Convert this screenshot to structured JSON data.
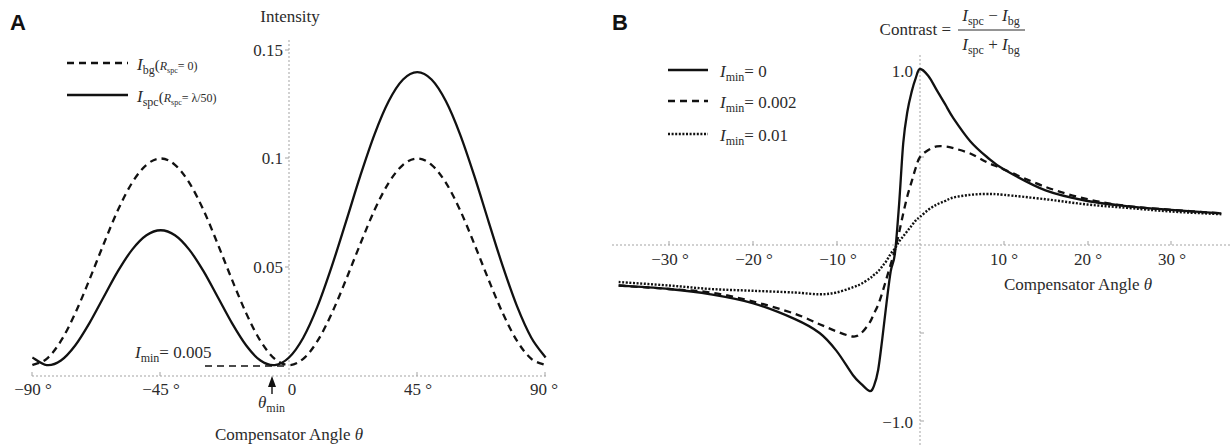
{
  "colors": {
    "curve": "#111111",
    "axis": "#a3a3a3",
    "text": "#2b2b2b"
  },
  "panel_a": {
    "letter": "A",
    "y_axis_title": "Intensity",
    "x_axis_title": {
      "text": "Compensator Angle ",
      "symbol": "θ"
    },
    "x_tick_labels": [
      "−90 °",
      "−45 °",
      "0",
      "45 °",
      "90 °"
    ],
    "y_tick_labels": [
      "0.05",
      "0.1",
      "0.15"
    ],
    "legend": [
      {
        "symbol": "I",
        "sub": "bg",
        "param_open": "(",
        "param_symbol": "R",
        "param_sub": "spc",
        "param_rest": "= 0)",
        "style": "dashed"
      },
      {
        "symbol": "I",
        "sub": "spc",
        "param_open": "(",
        "param_symbol": "R",
        "param_sub": "spc",
        "param_rest": "= λ/50)",
        "style": "solid"
      }
    ],
    "imin_annotation": {
      "symbol": "I",
      "sub": "min",
      "rest": "= 0.005"
    },
    "theta_min_annotation": {
      "symbol": "θ",
      "sub": "min"
    }
  },
  "panel_b": {
    "letter": "B",
    "y_axis_title": {
      "prefix": "Contrast =",
      "numerator": {
        "a_symbol": "I",
        "a_sub": "spc",
        "op": " − ",
        "b_symbol": "I",
        "b_sub": "bg"
      },
      "denominator": {
        "a_symbol": "I",
        "a_sub": "spc",
        "op": " + ",
        "b_symbol": "I",
        "b_sub": "bg"
      }
    },
    "x_axis_title": {
      "text": "Compensator Angle ",
      "symbol": "θ"
    },
    "x_tick_labels": [
      "−30 °",
      "−20 °",
      "−10 °",
      "10 °",
      "20 °",
      "30 °"
    ],
    "y_tick_labels": [
      "1.0",
      "−1.0"
    ],
    "legend": [
      {
        "symbol": "I",
        "sub": "min",
        "rest": "= 0",
        "style": "solid"
      },
      {
        "symbol": "I",
        "sub": "min",
        "rest": "= 0.002",
        "style": "dashed"
      },
      {
        "symbol": "I",
        "sub": "min",
        "rest": "= 0.01",
        "style": "dotted"
      }
    ]
  },
  "chart_data": [
    {
      "type": "line",
      "panel": "A",
      "title": "Intensity",
      "xlabel": "Compensator Angle θ",
      "ylabel": "Intensity",
      "xlim": [
        -90,
        90
      ],
      "ylim": [
        0,
        0.15
      ],
      "x_ticks": [
        -90,
        -45,
        0,
        45,
        90
      ],
      "y_ticks": [
        0.05,
        0.1,
        0.15
      ],
      "grid": false,
      "legend_position": "upper left",
      "x": [
        -90,
        -85,
        -80,
        -75,
        -70,
        -65,
        -60,
        -55,
        -50,
        -45,
        -40,
        -35,
        -30,
        -25,
        -20,
        -15,
        -10,
        -5,
        0,
        5,
        10,
        15,
        20,
        25,
        30,
        35,
        40,
        45,
        50,
        55,
        60,
        65,
        70,
        75,
        80,
        85,
        90
      ],
      "series": [
        {
          "name": "I_bg (R_spc = 0)",
          "style": "dashed",
          "values": [
            0.005,
            0.0079,
            0.0161,
            0.0288,
            0.0443,
            0.0607,
            0.0763,
            0.0889,
            0.0971,
            0.1,
            0.0971,
            0.0889,
            0.0763,
            0.0607,
            0.0443,
            0.0288,
            0.0161,
            0.0079,
            0.005,
            0.0079,
            0.0161,
            0.0288,
            0.0443,
            0.0607,
            0.0763,
            0.0889,
            0.0971,
            0.1,
            0.0971,
            0.0889,
            0.0763,
            0.0607,
            0.0443,
            0.0288,
            0.0161,
            0.0079,
            0.005
          ]
        },
        {
          "name": "I_spc (R_spc = λ/50)",
          "style": "solid",
          "values": [
            0.0085,
            0.005,
            0.0071,
            0.014,
            0.0243,
            0.0363,
            0.0482,
            0.0581,
            0.0647,
            0.067,
            0.0647,
            0.0581,
            0.0482,
            0.0363,
            0.0243,
            0.014,
            0.0071,
            0.005,
            0.0085,
            0.0176,
            0.032,
            0.0504,
            0.071,
            0.092,
            0.1111,
            0.1264,
            0.1363,
            0.1397,
            0.1363,
            0.1264,
            0.1111,
            0.092,
            0.071,
            0.0504,
            0.032,
            0.0176,
            0.0085
          ]
        }
      ],
      "annotations": [
        {
          "text": "I_min = 0.005",
          "type": "horizontal dashed segment",
          "y": 0.005,
          "x_range": [
            -29,
            0
          ]
        },
        {
          "text": "θ_min",
          "type": "arrow",
          "x": -5.5
        }
      ]
    },
    {
      "type": "line",
      "panel": "B",
      "title": "Contrast = (I_spc − I_bg) / (I_spc + I_bg)",
      "xlabel": "Compensator Angle θ",
      "ylabel": "Contrast",
      "xlim": [
        -36,
        36
      ],
      "ylim": [
        -1.1,
        1.1
      ],
      "x_ticks": [
        -30,
        -20,
        -10,
        10,
        20,
        30
      ],
      "y_ticks": [
        1.0,
        -1.0
      ],
      "grid": false,
      "legend_position": "upper left",
      "x": [
        -36,
        -30,
        -25,
        -20,
        -15,
        -12,
        -10,
        -8,
        -7,
        -6,
        -5.5,
        -5,
        -4.5,
        -4,
        -3.5,
        -3,
        -2.5,
        -2,
        -1.5,
        -1,
        -0.5,
        0,
        1,
        2,
        3,
        4,
        6,
        8,
        10,
        15,
        20,
        25,
        30,
        36
      ],
      "series": [
        {
          "name": "I_min = 0",
          "style": "solid",
          "values": [
            -0.23,
            -0.25,
            -0.28,
            -0.33,
            -0.42,
            -0.5,
            -0.6,
            -0.74,
            -0.79,
            -0.83,
            -0.8,
            -0.71,
            -0.53,
            -0.33,
            -0.15,
            -0.05,
            0.23,
            0.58,
            0.76,
            0.87,
            0.95,
            1.0,
            0.96,
            0.88,
            0.8,
            0.72,
            0.59,
            0.5,
            0.43,
            0.31,
            0.25,
            0.22,
            0.2,
            0.18
          ]
        },
        {
          "name": "I_min = 0.002",
          "style": "dashed",
          "values": [
            -0.23,
            -0.25,
            -0.27,
            -0.32,
            -0.39,
            -0.45,
            -0.49,
            -0.52,
            -0.5,
            -0.44,
            -0.39,
            -0.34,
            -0.27,
            -0.19,
            -0.11,
            -0.03,
            0.07,
            0.18,
            0.28,
            0.36,
            0.44,
            0.5,
            0.54,
            0.56,
            0.56,
            0.55,
            0.52,
            0.47,
            0.43,
            0.33,
            0.26,
            0.22,
            0.2,
            0.18
          ]
        },
        {
          "name": "I_min = 0.01",
          "style": "dotted",
          "values": [
            -0.21,
            -0.23,
            -0.25,
            -0.26,
            -0.27,
            -0.28,
            -0.27,
            -0.24,
            -0.22,
            -0.19,
            -0.17,
            -0.15,
            -0.12,
            -0.09,
            -0.05,
            -0.02,
            0.02,
            0.05,
            0.08,
            0.11,
            0.14,
            0.16,
            0.2,
            0.23,
            0.25,
            0.27,
            0.285,
            0.29,
            0.285,
            0.26,
            0.23,
            0.21,
            0.19,
            0.175
          ]
        }
      ]
    }
  ]
}
